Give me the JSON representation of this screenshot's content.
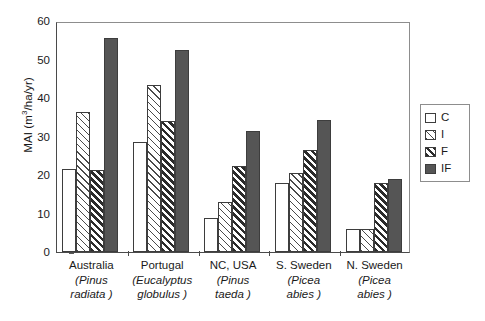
{
  "chart_data": {
    "type": "bar",
    "title": "",
    "xlabel": "",
    "ylabel": "MAI (m3/ha/yr)",
    "ylabel_parts": {
      "prefix": "MAI (m",
      "sup": "3",
      "suffix": "/ha/yr)"
    },
    "ylim": [
      0,
      60
    ],
    "yticks": [
      0,
      10,
      20,
      30,
      40,
      50,
      60
    ],
    "grid": false,
    "legend_position": "right",
    "categories": [
      "Australia (Pinus radiata)",
      "Portugal (Eucalyptus globulus)",
      "NC, USA (Pinus taeda)",
      "S. Sweden (Picea abies)",
      "N. Sweden (Picea abies)"
    ],
    "category_labels": [
      {
        "place": "Australia",
        "species_open": "(Pinus",
        "species_close": "radiata )"
      },
      {
        "place": "Portugal",
        "species_open": "(Eucalyptus",
        "species_close": "globulus )"
      },
      {
        "place": "NC, USA",
        "species_open": "(Pinus",
        "species_close": "taeda )"
      },
      {
        "place": "S. Sweden",
        "species_open": "(Picea",
        "species_close": "abies )"
      },
      {
        "place": "N. Sweden",
        "species_open": "(Picea",
        "species_close": "abies )"
      }
    ],
    "series": [
      {
        "name": "C",
        "fill": "white",
        "values": [
          21.5,
          28.5,
          8.8,
          18.0,
          6.0
        ]
      },
      {
        "name": "I",
        "fill": "light-hatch",
        "values": [
          36.4,
          43.5,
          13.0,
          20.5,
          6.0
        ]
      },
      {
        "name": "F",
        "fill": "dark-hatch",
        "values": [
          21.4,
          34.0,
          22.4,
          26.5,
          18.0
        ]
      },
      {
        "name": "IF",
        "fill": "solid-grey",
        "values": [
          55.5,
          52.6,
          31.4,
          34.4,
          19.0
        ]
      }
    ]
  },
  "legend": {
    "items": [
      {
        "label": "C"
      },
      {
        "label": "I"
      },
      {
        "label": "F"
      },
      {
        "label": "IF"
      }
    ]
  },
  "colors": {
    "axis": "#4a4a4a",
    "frame": "#8d8d8d",
    "bar_outline": "#3d3d3d",
    "solid_grey": "#555555",
    "hatch_dark": "#2b2b2b",
    "hatch_light": "#4a4a4a",
    "background": "#ffffff"
  }
}
